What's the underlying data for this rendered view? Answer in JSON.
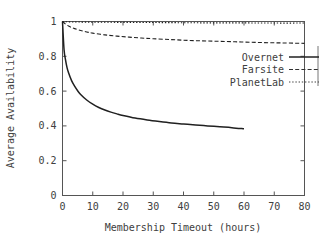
{
  "chart_data": {
    "type": "line",
    "title": "",
    "xlabel": "Membership Timeout (hours)",
    "ylabel": "Average Availability",
    "xlim": [
      0,
      80
    ],
    "ylim": [
      0,
      1
    ],
    "xticks": [
      "0",
      "10",
      "20",
      "30",
      "40",
      "50",
      "60",
      "70",
      "80"
    ],
    "xtick_values": [
      0,
      10,
      20,
      30,
      40,
      50,
      60,
      70,
      80
    ],
    "yticks": [
      "0",
      "0.2",
      "0.4",
      "0.6",
      "0.8",
      "1"
    ],
    "ytick_values": [
      0,
      0.2,
      0.4,
      0.6,
      0.8,
      1
    ],
    "grid": false,
    "legend_position": "upper right",
    "series": [
      {
        "name": "Overnet",
        "style": "solid",
        "color": "#202020",
        "x": [
          0,
          0.5,
          1,
          1.5,
          2,
          3,
          4,
          5,
          6,
          8,
          10,
          12,
          14,
          16,
          18,
          20,
          24,
          28,
          32,
          36,
          40,
          44,
          48,
          52,
          56,
          60
        ],
        "y": [
          1.0,
          0.84,
          0.78,
          0.735,
          0.705,
          0.66,
          0.628,
          0.602,
          0.581,
          0.549,
          0.525,
          0.506,
          0.491,
          0.479,
          0.469,
          0.46,
          0.445,
          0.434,
          0.425,
          0.417,
          0.411,
          0.405,
          0.4,
          0.395,
          0.39,
          0.383
        ]
      },
      {
        "name": "Farsite",
        "style": "dashed",
        "color": "#303030",
        "x": [
          0,
          1,
          2,
          3,
          4,
          6,
          8,
          10,
          14,
          18,
          22,
          26,
          30,
          36,
          42,
          48,
          54,
          60,
          66,
          72,
          78,
          80
        ],
        "y": [
          1.0,
          0.985,
          0.974,
          0.966,
          0.959,
          0.948,
          0.94,
          0.933,
          0.923,
          0.916,
          0.91,
          0.905,
          0.901,
          0.896,
          0.891,
          0.888,
          0.885,
          0.882,
          0.879,
          0.877,
          0.875,
          0.874
        ]
      },
      {
        "name": "PlanetLab",
        "style": "dotted",
        "color": "#404040",
        "x": [
          0,
          2,
          5,
          10,
          20,
          30,
          40,
          50,
          60,
          70,
          80
        ],
        "y": [
          1.0,
          0.998,
          0.997,
          0.996,
          0.995,
          0.994,
          0.993,
          0.992,
          0.992,
          0.991,
          0.991
        ]
      }
    ]
  },
  "legend": {
    "entries": [
      {
        "label": "Overnet"
      },
      {
        "label": "Farsite"
      },
      {
        "label": "PlanetLab"
      }
    ]
  }
}
